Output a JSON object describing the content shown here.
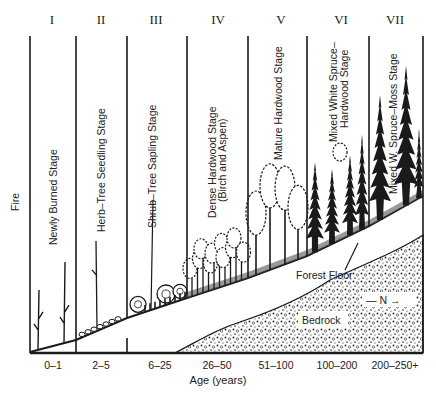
{
  "diagram": {
    "type": "forest-succession-stages",
    "side_label": "Fire",
    "x_axis_title": "Age (years)",
    "stages": [
      {
        "numeral": "I",
        "name": [
          "Newly Burned Stage"
        ],
        "age": "0–1"
      },
      {
        "numeral": "II",
        "name": [
          "Herb–Tree Seedling Stage"
        ],
        "age": "2–5"
      },
      {
        "numeral": "III",
        "name": [
          "Shrub–Tree Sapling Stage"
        ],
        "age": "6–25"
      },
      {
        "numeral": "IV",
        "name": [
          "Dense Hardwood Stage",
          "(Birch and Aspen)"
        ],
        "age": "26–50"
      },
      {
        "numeral": "V",
        "name": [
          "Mature Hardwood Stage"
        ],
        "age": "51–100"
      },
      {
        "numeral": "VI",
        "name": [
          "Mixed White Spruce–",
          "Hardwood Stage"
        ],
        "age": "100–200"
      },
      {
        "numeral": "VII",
        "name": [
          "Mixed W. Spruce–Moss Stage"
        ],
        "age": "200–250+"
      }
    ],
    "annotations": {
      "forest_floor": "Forest Floor",
      "bedrock": "Bedrock",
      "direction": "— N →"
    },
    "colors": {
      "ink": "#1a1a1a",
      "background": "#ffffff"
    }
  }
}
